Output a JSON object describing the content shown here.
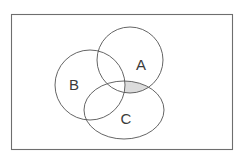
{
  "figure": {
    "background_color": "#ffffff",
    "width": 248,
    "height": 164
  },
  "universe": {
    "name": "universal-set-rectangle",
    "label": "",
    "x": 11,
    "y": 14,
    "width": 222,
    "height": 136,
    "stroke_color": "#6e6e6e",
    "stroke_width": 1.1,
    "fill_color": "none"
  },
  "sets": [
    {
      "id": "A",
      "label": "A",
      "shape": "circle",
      "cx": 130,
      "cy": 60,
      "rx": 33,
      "ry": 33,
      "label_x": 141,
      "label_y": 66,
      "stroke_color": "#545454",
      "fill_color": "none"
    },
    {
      "id": "B",
      "label": "B",
      "shape": "circle",
      "cx": 90,
      "cy": 85,
      "rx": 35,
      "ry": 35,
      "label_x": 74,
      "label_y": 86,
      "stroke_color": "#545454",
      "fill_color": "none"
    },
    {
      "id": "C",
      "label": "C",
      "shape": "ellipse",
      "cx": 124,
      "cy": 110,
      "rx": 40,
      "ry": 29,
      "label_x": 126,
      "label_y": 120,
      "stroke_color": "#545454",
      "fill_color": "none"
    }
  ],
  "shaded_regions": [
    {
      "id": "A-and-C-not-B",
      "description": "Intersection of set A and set C excluding set B",
      "expression": "A ∩ C ∩ B'",
      "fill_color": "#dcdcdc",
      "opacity": 1
    }
  ],
  "legend": {
    "visible": false,
    "entries": []
  }
}
